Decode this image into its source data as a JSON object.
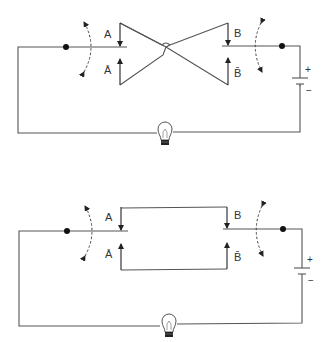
{
  "diagram": {
    "type": "circuit-schematic",
    "circuits": [
      {
        "id": "top",
        "description": "Two changeover switches with crossed connections (XOR-like wiring), battery and lamp",
        "switch_left": {
          "upper_label": "A",
          "lower_label": "Ā"
        },
        "switch_right": {
          "upper_label": "B",
          "lower_label": "B̄"
        },
        "interconnect": "crossed",
        "battery": {
          "plus": "+",
          "minus": "−"
        },
        "lamp": "light-bulb"
      },
      {
        "id": "bottom",
        "description": "Two changeover switches with straight connections (XNOR-like wiring), battery and lamp",
        "switch_left": {
          "upper_label": "A",
          "lower_label": "Ā"
        },
        "switch_right": {
          "upper_label": "B",
          "lower_label": "B̄"
        },
        "interconnect": "straight",
        "battery": {
          "plus": "+",
          "minus": "−"
        },
        "lamp": "light-bulb"
      }
    ],
    "colors": {
      "wire": "#555555",
      "background": "#ffffff"
    }
  }
}
